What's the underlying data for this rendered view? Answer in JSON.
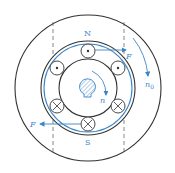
{
  "diagram": {
    "type": "induction-motor-cross-section",
    "labels": {
      "north_pole": "N",
      "south_pole": "S",
      "force_top": "F",
      "force_bottom": "F",
      "field_speed": "n",
      "field_speed_sub": "0",
      "rotor_speed": "n"
    },
    "colors": {
      "outline": "#333333",
      "accent": "#3d86c6",
      "dashed": "#555555"
    },
    "slots": [
      {
        "position": "top",
        "current": "dot"
      },
      {
        "position": "upper-left",
        "current": "dot"
      },
      {
        "position": "upper-right",
        "current": "dot"
      },
      {
        "position": "lower-left",
        "current": "cross"
      },
      {
        "position": "lower-right",
        "current": "cross"
      },
      {
        "position": "bottom",
        "current": "cross"
      }
    ]
  }
}
